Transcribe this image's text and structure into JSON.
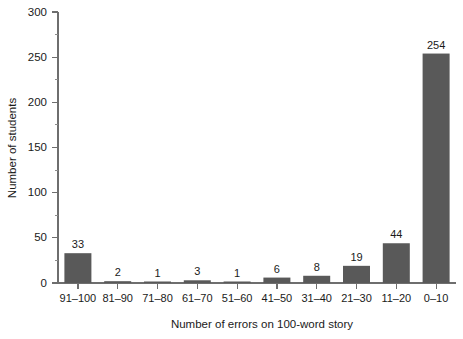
{
  "chart_data": {
    "type": "bar",
    "title": "",
    "subtitle": "",
    "xlabel": "Number of errors on 100-word story",
    "ylabel": "Number of students",
    "categories": [
      "91–100",
      "81–90",
      "71–80",
      "61–70",
      "51–60",
      "41–50",
      "31–40",
      "21–30",
      "11–20",
      "0–10"
    ],
    "values": [
      33,
      2,
      1,
      3,
      1,
      6,
      8,
      19,
      44,
      254
    ],
    "value_labels": [
      "33",
      "2",
      "1",
      "3",
      "1",
      "6",
      "8",
      "19",
      "44",
      "254"
    ],
    "ylim": [
      0,
      300
    ],
    "y_ticks": [
      0,
      50,
      100,
      150,
      200,
      250,
      300
    ],
    "y_tick_labels": [
      "0",
      "50",
      "100",
      "150",
      "200",
      "250",
      "300"
    ],
    "y_minor_ticks": [
      25,
      75,
      125,
      175,
      225,
      275
    ],
    "grid": false,
    "legend": null,
    "legend_position": "none",
    "bar_color": "#595959",
    "axis_color": "#6e6e6e",
    "background_color": "#ffffff",
    "orientation": "vertical"
  }
}
